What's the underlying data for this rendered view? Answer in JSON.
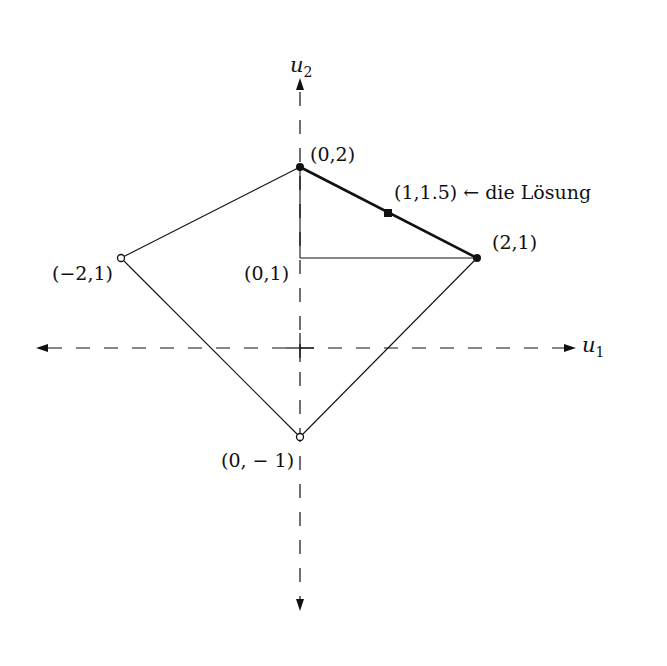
{
  "diagram": {
    "axes": {
      "x_label": "u",
      "x_sub": "1",
      "y_label": "u",
      "y_sub": "2"
    },
    "points": [
      {
        "id": "p02",
        "label": "(0,2)",
        "u1": 0,
        "u2": 2,
        "marker": "filled-dot"
      },
      {
        "id": "p21",
        "label": "(2,1)",
        "u1": 2,
        "u2": 1,
        "marker": "filled-dot"
      },
      {
        "id": "pm21",
        "label": "(−2,1)",
        "u1": -2,
        "u2": 1,
        "marker": "open-dot"
      },
      {
        "id": "p0m1",
        "label": "(0, − 1)",
        "u1": 0,
        "u2": -1,
        "marker": "open-dot"
      },
      {
        "id": "p01",
        "label": "(0,1)",
        "u1": 0,
        "u2": 1,
        "marker": "none"
      },
      {
        "id": "sol",
        "label": "(1,1.5) ← die Lösung",
        "u1": 1,
        "u2": 1.5,
        "marker": "filled-square"
      }
    ],
    "edges": [
      {
        "from": "p02",
        "to": "p21",
        "style": "bold"
      },
      {
        "from": "p21",
        "to": "p0m1",
        "style": "thin"
      },
      {
        "from": "p0m1",
        "to": "pm21",
        "style": "thin"
      },
      {
        "from": "pm21",
        "to": "p02",
        "style": "thin"
      },
      {
        "from": "p02",
        "to": "p01",
        "style": "thin"
      },
      {
        "from": "p01",
        "to": "p21",
        "style": "thin"
      }
    ],
    "colors": {
      "ink": "#111111",
      "background": "#ffffff"
    }
  }
}
